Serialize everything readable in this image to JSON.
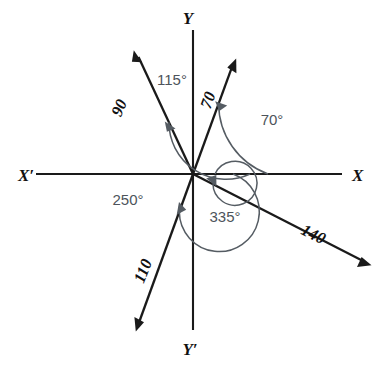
{
  "figure": {
    "origin": {
      "x": 193,
      "y": 174
    },
    "colors": {
      "axis": "#1a1a1a",
      "ray": "#1a1a1a",
      "arc": "#555c63",
      "label": "#111111",
      "angle_label": "#4d545b",
      "background": "#ffffff"
    },
    "axes": [
      {
        "name": "x-negative-axis-label",
        "text": "X′",
        "x": 18,
        "y": 181
      },
      {
        "name": "x-positive-axis-label",
        "text": "X",
        "x": 352,
        "y": 181
      },
      {
        "name": "y-positive-axis-label",
        "text": "Y",
        "x": 188,
        "y": 24
      },
      {
        "name": "y-negative-axis-label",
        "text": "Y′",
        "x": 186,
        "y": 355
      }
    ],
    "rays": [
      {
        "name": "ray-70",
        "label": "70",
        "angle_deg": 70,
        "label_x": 213,
        "label_y": 102,
        "label_rotate": -70
      },
      {
        "name": "ray-90",
        "label": "90",
        "angle_deg": 115,
        "label_x": 122,
        "label_y": 108,
        "label_rotate": -66
      },
      {
        "name": "ray-110",
        "label": "110",
        "angle_deg": 250,
        "label_x": 146,
        "label_y": 272,
        "label_rotate": -68
      },
      {
        "name": "ray-140",
        "label": "140",
        "angle_deg": 333,
        "label_x": 310,
        "label_y": 240,
        "label_rotate": 27
      }
    ],
    "angle_arcs": [
      {
        "name": "arc-70",
        "label": "70°",
        "value": 70,
        "radius": 75,
        "label_x": 272,
        "label_y": 119
      },
      {
        "name": "arc-115",
        "label": "115°",
        "value": 115,
        "radius": 57,
        "label_x": 153,
        "label_y": 81
      },
      {
        "name": "arc-250",
        "label": "250°",
        "value": 250,
        "radius": 40,
        "label_x": 105,
        "label_y": 203
      },
      {
        "name": "arc-335",
        "label": "335°",
        "value": 335,
        "radius": 22,
        "label_x": 200,
        "label_y": 224
      }
    ]
  }
}
